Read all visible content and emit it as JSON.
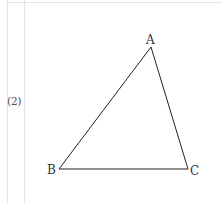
{
  "problem": {
    "number_label": "(2)"
  },
  "figure": {
    "type": "triangle",
    "stroke_color": "#222222",
    "vertices": [
      {
        "name": "A",
        "label": "A",
        "x": 151,
        "y": 47
      },
      {
        "name": "B",
        "label": "B",
        "x": 59,
        "y": 169
      },
      {
        "name": "C",
        "label": "C",
        "x": 188,
        "y": 169
      }
    ]
  }
}
